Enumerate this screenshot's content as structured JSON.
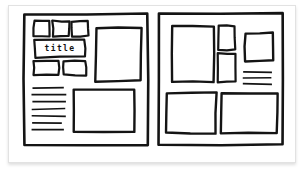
{
  "document": {
    "kind": "hand-drawn wireframe sketch",
    "background_color": "#ffffff",
    "card_background": "#ffffff",
    "ink_color": "#141414",
    "border_color": "#e2e2e2"
  },
  "canvas": {
    "width": 306,
    "height": 173
  },
  "left_page": {
    "label": "left-page-wireframe",
    "frame": {
      "x": 24,
      "y": 14,
      "w": 124,
      "h": 131
    },
    "title_box": {
      "label": "title",
      "text": "title",
      "x": 35,
      "y": 40,
      "w": 50,
      "h": 17
    },
    "thumbnail_row_top": [
      {
        "label": "thumb-1",
        "x": 34,
        "y": 21,
        "w": 16,
        "h": 15
      },
      {
        "label": "thumb-2",
        "x": 53,
        "y": 21,
        "w": 16,
        "h": 15
      },
      {
        "label": "thumb-3",
        "x": 72,
        "y": 21,
        "w": 16,
        "h": 15
      }
    ],
    "thumbnail_row_bottom": [
      {
        "label": "thumb-4",
        "x": 34,
        "y": 61,
        "w": 25,
        "h": 14
      },
      {
        "label": "thumb-5",
        "x": 63,
        "y": 61,
        "w": 23,
        "h": 14
      }
    ],
    "image_box_top": {
      "label": "image-placeholder-top",
      "x": 96,
      "y": 28,
      "w": 45,
      "h": 53
    },
    "image_box_bottom": {
      "label": "image-placeholder-bottom",
      "x": 74,
      "y": 90,
      "w": 60,
      "h": 42
    },
    "text_lines": {
      "label": "text-placeholder-lines",
      "count": 7,
      "x": 32,
      "y": 88,
      "widths": [
        32,
        34,
        34,
        33,
        34,
        30,
        32
      ],
      "spacing": 7
    }
  },
  "right_page": {
    "label": "right-page-wireframe",
    "frame": {
      "x": 159,
      "y": 14,
      "w": 124,
      "h": 131
    },
    "image_box_large": {
      "label": "image-placeholder-large",
      "x": 172,
      "y": 26,
      "w": 42,
      "h": 56
    },
    "side_boxes": [
      {
        "label": "side-box-top",
        "x": 218,
        "y": 26,
        "w": 17,
        "h": 24
      },
      {
        "label": "side-box-bottom",
        "x": 218,
        "y": 54,
        "w": 17,
        "h": 28
      }
    ],
    "image_box_square": {
      "label": "image-placeholder-square",
      "x": 245,
      "y": 33,
      "w": 28,
      "h": 28
    },
    "text_lines": {
      "label": "text-placeholder-lines",
      "count": 3,
      "x": 243,
      "y": 72,
      "widths": [
        29,
        29,
        29
      ],
      "spacing": 6
    },
    "bottom_boxes": [
      {
        "label": "bottom-box-left",
        "x": 166,
        "y": 93,
        "w": 50,
        "h": 40
      },
      {
        "label": "bottom-box-right",
        "x": 221,
        "y": 93,
        "w": 56,
        "h": 40
      }
    ]
  }
}
